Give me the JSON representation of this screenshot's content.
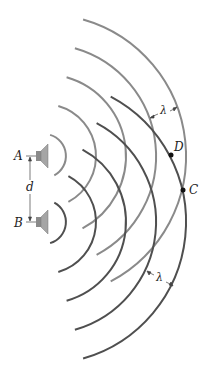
{
  "figure": {
    "labels": {
      "speaker_a": "A",
      "speaker_b": "B",
      "separation": "d",
      "point_c": "C",
      "point_d": "D",
      "wavelength_top": "λ",
      "wavelength_bottom": "λ"
    },
    "colors": {
      "waves_a": "#8a8a8a",
      "waves_b": "#4f4f4f",
      "speaker": "#9a9a9a",
      "text": "#222222"
    },
    "sources": {
      "a": {
        "cx": 44,
        "cy": 156
      },
      "b": {
        "cx": 44,
        "cy": 222
      }
    },
    "wave_radii": [
      22,
      52,
      82,
      112,
      142
    ],
    "points": {
      "d": {
        "x": 171,
        "y": 155
      },
      "c": {
        "x": 183,
        "y": 190
      }
    }
  }
}
